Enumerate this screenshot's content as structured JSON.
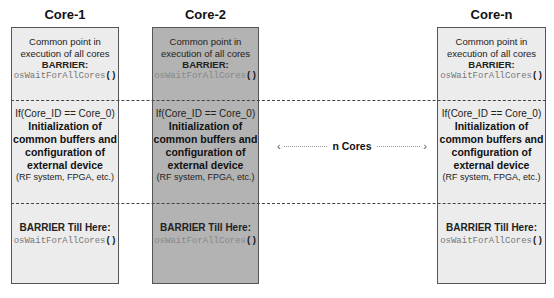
{
  "cores": [
    {
      "title": "Core-1",
      "shade": "light",
      "section1": {
        "line1": "Common point in",
        "line2": "execution of all cores",
        "barrier": "BARRIER:",
        "call": "osWaitForAllCores",
        "paren": "()"
      },
      "section2": {
        "condition": "If(Core_ID == Core_0)",
        "line1": "Initialization of",
        "line2": "common buffers and",
        "line3": "configuration of",
        "line4": "external device",
        "note": "(RF system, FPGA, etc.)"
      },
      "section3": {
        "barrier": "BARRIER Till Here:",
        "call": "osWaitForAllCores",
        "paren": "()"
      }
    },
    {
      "title": "Core-2",
      "shade": "dark",
      "section1": {
        "line1": "Common point in",
        "line2": "execution of all cores",
        "barrier": "BARRIER:",
        "call": "osWaitForAllCores",
        "paren": "()"
      },
      "section2": {
        "condition": "If(Core_ID == Core_0)",
        "line1": "Initialization of",
        "line2": "common buffers and",
        "line3": "configuration of",
        "line4": "external device",
        "note": "(RF system, FPGA, etc.)"
      },
      "section3": {
        "barrier": "BARRIER Till Here:",
        "call": "osWaitForAllCores",
        "paren": "()"
      }
    },
    {
      "title": "Core-n",
      "shade": "light",
      "section1": {
        "line1": "Common point in",
        "line2": "execution of all cores",
        "barrier": "BARRIER:",
        "call": "osWaitForAllCores",
        "paren": "()"
      },
      "section2": {
        "condition": "If(Core_ID == Core_0)",
        "line1": "Initialization of",
        "line2": "common buffers and",
        "line3": "configuration of",
        "line4": "external device",
        "note": "(RF system, FPGA, etc.)"
      },
      "section3": {
        "barrier": "BARRIER Till Here:",
        "call": "osWaitForAllCores",
        "paren": "()"
      }
    }
  ],
  "n_cores": {
    "left_chevron": "‹",
    "label": "n Cores",
    "right_chevron": "›"
  },
  "colors": {
    "light_box": "#ececec",
    "dark_box": "#b3b3b3",
    "border": "#555555",
    "code_text": "#777777"
  }
}
